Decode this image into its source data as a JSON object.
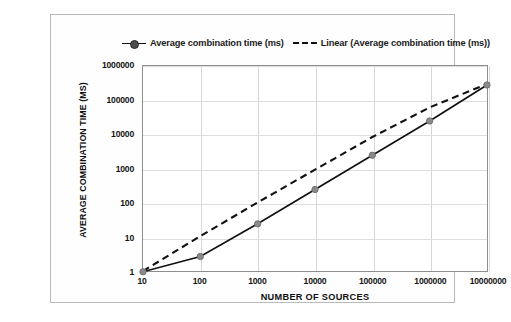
{
  "chart_data": {
    "type": "line",
    "title": "",
    "xlabel": "NUMBER OF SOURCES",
    "ylabel": "AVERAGE COMBINATION TIME (MS)",
    "xscale": "log",
    "yscale": "log",
    "xlim": [
      10,
      10000000
    ],
    "ylim": [
      1,
      1000000
    ],
    "grid": true,
    "legend_position": "top-center",
    "xticks": [
      "10",
      "100",
      "1000",
      "10000",
      "100000",
      "1000000",
      "10000000"
    ],
    "yticks": [
      "1",
      "10",
      "100",
      "1000",
      "10000",
      "100000",
      "1000000"
    ],
    "x": [
      10,
      100,
      1000,
      10000,
      100000,
      1000000,
      10000000
    ],
    "series": [
      {
        "name": "Average combination time (ms)",
        "style": "solid",
        "marker": "circle",
        "color": "#111111",
        "marker_color": "#8a8a8a",
        "values": [
          1,
          2.8,
          25,
          250,
          2500,
          25000,
          280000
        ]
      },
      {
        "name": "Linear (Average combination time (ms))",
        "style": "dashed",
        "marker": "none",
        "color": "#111111",
        "values": [
          1.05,
          11,
          105,
          950,
          8500,
          62000,
          300000
        ]
      }
    ]
  },
  "legend": {
    "entries": [
      {
        "label": "Average combination time (ms)",
        "key": "line-marker-key-icon"
      },
      {
        "label": "Linear (Average combination time (ms))",
        "key": "dashed-line-key-icon"
      }
    ]
  },
  "axes": {
    "x_title": "NUMBER OF SOURCES",
    "y_title": "AVERAGE COMBINATION TIME (MS)"
  }
}
